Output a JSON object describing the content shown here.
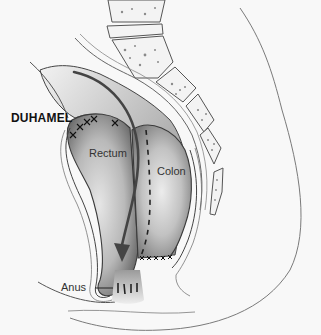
{
  "figure": {
    "title": "DUHAMEL",
    "labels": {
      "rectum": "Rectum",
      "colon": "Colon",
      "anus": "Anus"
    },
    "colors": {
      "background": "#f8f8f8",
      "outline": "#3a3a3a",
      "shade_dark": "#6e6e6e",
      "shade_light": "#d8d8d8",
      "text": "#222222"
    },
    "elements": [
      "sacrum-vertebrae",
      "coccyx",
      "rectum-pouch",
      "pulled-through-colon",
      "staple-line",
      "suture-marks",
      "pathway-arrow",
      "anal-canal",
      "body-contour"
    ]
  }
}
